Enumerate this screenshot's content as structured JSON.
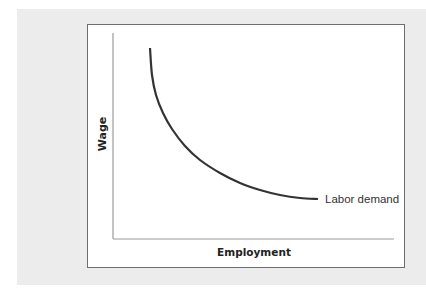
{
  "chart_data": {
    "type": "line",
    "title": "",
    "xlabel": "Employment",
    "ylabel": "Wage",
    "grid": false,
    "legend": null,
    "series": [
      {
        "name": "Labor demand",
        "description": "Downward-sloping convex labor demand curve",
        "points_px": [
          [
            150,
            48
          ],
          [
            152,
            75
          ],
          [
            156,
            95
          ],
          [
            163,
            113
          ],
          [
            172,
            129
          ],
          [
            185,
            146
          ],
          [
            200,
            160
          ],
          [
            220,
            173
          ],
          [
            240,
            183
          ],
          [
            260,
            190
          ],
          [
            280,
            195
          ],
          [
            300,
            198
          ],
          [
            318,
            199
          ]
        ],
        "annotation": "Labor demand"
      }
    ],
    "axes": {
      "origin_px": [
        113,
        239
      ],
      "y_top_px": 33,
      "x_right_px": 394,
      "ticks": "none"
    }
  },
  "labels": {
    "y_axis": "Wage",
    "x_axis": "Employment",
    "curve": "Labor demand"
  },
  "colors": {
    "panel_bg": "#ececec",
    "frame_border": "#6e6e6e",
    "axis": "#9a9a9a",
    "curve": "#333333"
  }
}
